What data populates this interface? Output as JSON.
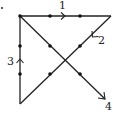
{
  "diagram": {
    "stray_mark": {
      "x": 2,
      "y": 8
    },
    "dots": [
      {
        "x": 20,
        "y": 16
      },
      {
        "x": 50,
        "y": 16
      },
      {
        "x": 80,
        "y": 16
      },
      {
        "x": 20,
        "y": 46
      },
      {
        "x": 50,
        "y": 46
      },
      {
        "x": 80,
        "y": 46
      },
      {
        "x": 20,
        "y": 74
      },
      {
        "x": 50,
        "y": 74
      },
      {
        "x": 80,
        "y": 74
      }
    ],
    "segments": [
      {
        "label": "1",
        "from": [
          20,
          16
        ],
        "to": [
          111,
          16
        ],
        "label_pos": [
          62,
          9
        ]
      },
      {
        "label": "2",
        "from": [
          111,
          16
        ],
        "to": [
          20,
          104
        ],
        "label_pos": [
          101,
          44
        ]
      },
      {
        "label": "3",
        "from": [
          20,
          104
        ],
        "to": [
          20,
          16
        ],
        "label_pos": [
          9,
          64
        ]
      },
      {
        "label": "4",
        "from": [
          20,
          16
        ],
        "to": [
          105,
          99
        ],
        "label_pos": [
          108,
          109
        ]
      }
    ],
    "colors": {
      "line": "#222222",
      "dot": "#111111",
      "background": "#ffffff"
    }
  }
}
